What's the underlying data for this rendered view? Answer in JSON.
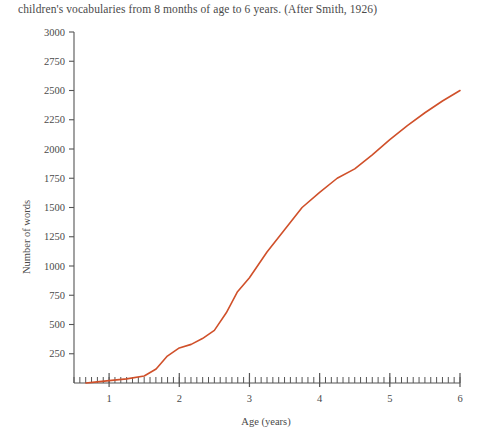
{
  "caption": "children's vocabularies from 8 months of age to 6 years. (After Smith, 1926)",
  "chart_data": {
    "type": "line",
    "title": "",
    "xlabel": "Age (years)",
    "ylabel": "Number of words",
    "xlim": [
      0.5,
      6
    ],
    "ylim": [
      0,
      3000
    ],
    "grid": false,
    "legend": "none",
    "line_color": "#d0502a",
    "axis_color": "#555555",
    "y_ticks": [
      250,
      500,
      750,
      1000,
      1250,
      1500,
      1750,
      2000,
      2250,
      2500,
      2750,
      3000
    ],
    "x_ticks": [
      1,
      2,
      3,
      4,
      5,
      6
    ],
    "x_minor_tick_interval": 0.0833,
    "series": [
      {
        "name": "Number of words",
        "x": [
          0.67,
          0.83,
          1.0,
          1.25,
          1.5,
          1.67,
          1.83,
          2.0,
          2.17,
          2.33,
          2.5,
          2.67,
          2.83,
          3.0,
          3.25,
          3.5,
          3.75,
          4.0,
          4.25,
          4.5,
          4.75,
          5.0,
          5.25,
          5.5,
          5.75,
          6.0
        ],
        "y": [
          0,
          10,
          20,
          35,
          60,
          120,
          230,
          300,
          330,
          380,
          450,
          600,
          780,
          900,
          1120,
          1310,
          1500,
          1630,
          1750,
          1830,
          1950,
          2080,
          2200,
          2310,
          2410,
          2500
        ]
      }
    ]
  },
  "axis_labels": {
    "y": [
      "3000",
      "2750",
      "2500",
      "2250",
      "2000",
      "1750",
      "1500",
      "1250",
      "1000",
      "750",
      "500",
      "250"
    ],
    "x": [
      "1",
      "2",
      "3",
      "4",
      "5",
      "6"
    ]
  }
}
